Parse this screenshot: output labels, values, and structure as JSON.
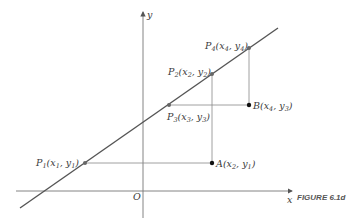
{
  "figure": {
    "caption": "FIGURE 6.1d",
    "axes": {
      "x_label": "x",
      "y_label": "y",
      "origin_label": "O"
    },
    "points": [
      {
        "id": "P1",
        "name": "P",
        "sub": "1",
        "coords": "(x",
        "cx": "1",
        "mid": ", y",
        "cy": "1",
        "end": ")"
      },
      {
        "id": "P2",
        "name": "P",
        "sub": "2",
        "coords": "(x",
        "cx": "2",
        "mid": ", y",
        "cy": "2",
        "end": ")"
      },
      {
        "id": "P3",
        "name": "P",
        "sub": "3",
        "coords": "(x",
        "cx": "3",
        "mid": ", y",
        "cy": "3",
        "end": ")"
      },
      {
        "id": "P4",
        "name": "P",
        "sub": "4",
        "coords": "(x",
        "cx": "4",
        "mid": ", y",
        "cy": "4",
        "end": ")"
      },
      {
        "id": "A",
        "name": "A",
        "sub": "",
        "coords": "(x",
        "cx": "2",
        "mid": ", y",
        "cy": "1",
        "end": ")"
      },
      {
        "id": "B",
        "name": "B",
        "sub": "",
        "coords": "(x",
        "cx": "4",
        "mid": ", y",
        "cy": "3",
        "end": ")"
      }
    ],
    "colors": {
      "line": "#555555",
      "axis": "#777777",
      "guide": "#888888",
      "point_on_line": "#666666",
      "point_off_line": "#111111"
    }
  }
}
